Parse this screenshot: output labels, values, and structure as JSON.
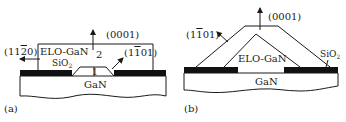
{
  "panels": [
    {
      "id": "a",
      "caption": "(a)",
      "labels": {
        "direction_up": "(0001)",
        "direction_left": "(11",
        "direction_left_bar": "2",
        "direction_left_end": "0)",
        "direction_facet": "(1",
        "direction_facet_bar": "1",
        "direction_facet_end": "01)",
        "layer": "ELO-GaN",
        "mask": "SiO",
        "mask_sub": "2",
        "substrate": "GaN",
        "region_1": "1",
        "region_2": "2"
      }
    },
    {
      "id": "b",
      "caption": "(b)",
      "labels": {
        "direction_up": "(0001)",
        "direction_facet": "(1",
        "direction_facet_bar": "1",
        "direction_facet_end": "01)",
        "layer": "ELO-GaN",
        "mask": "SiO",
        "mask_sub": "2",
        "substrate": "GaN"
      }
    }
  ],
  "colors": {
    "line": "#1a1a1a",
    "mask": "#111111",
    "background": "#ffffff"
  }
}
